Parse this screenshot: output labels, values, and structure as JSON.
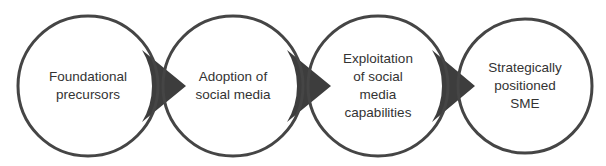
{
  "diagram": {
    "type": "process-flow",
    "direction": "left-to-right",
    "colors": {
      "background": "#ffffff",
      "circle_fill": "#ffffff",
      "circle_stroke": "#454545",
      "arrow_fill": "#3d3d3d",
      "text": "#333333"
    },
    "stages": [
      {
        "id": "stage-1",
        "label": "Foundational\nprecursors",
        "cx": 88,
        "cy": 86,
        "r": 70
      },
      {
        "id": "stage-2",
        "label": "Adoption of\nsocial media",
        "cx": 233,
        "cy": 86,
        "r": 70
      },
      {
        "id": "stage-3",
        "label": "Exploitation\nof social\nmedia\ncapabilities",
        "cx": 378,
        "cy": 86,
        "r": 70
      },
      {
        "id": "stage-4",
        "label": "Strategically\npositioned\nSME",
        "cx": 525,
        "cy": 86,
        "r": 67
      }
    ],
    "connectors": [
      {
        "from": "stage-1",
        "to": "stage-2",
        "tip_x": 186
      },
      {
        "from": "stage-2",
        "to": "stage-3",
        "tip_x": 331
      },
      {
        "from": "stage-3",
        "to": "stage-4",
        "tip_x": 475
      }
    ]
  }
}
